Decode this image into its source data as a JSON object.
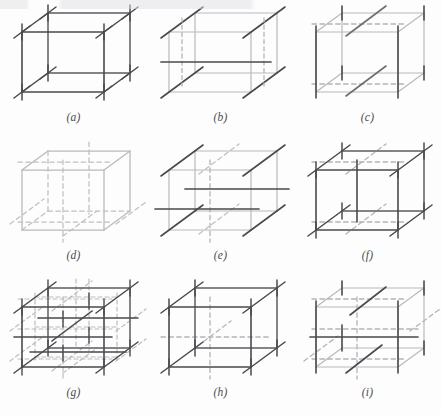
{
  "figure": {
    "type": "technical-illustration",
    "panel_count": 9,
    "columns": 3,
    "rows": 3
  },
  "colors": {
    "background": "#fdfdfd",
    "dark_line": "#4a4a4e",
    "mid_line": "#6d6d72",
    "light_line": "#b9b9bd",
    "dashed_line": "#b4b4b8",
    "caption_text": "#4a4a4a"
  },
  "geometry": {
    "front_left_x": 22,
    "front_right_x": 104,
    "front_top_y": 32,
    "front_bottom_y": 92,
    "depth_dx": 26,
    "depth_dy": -19,
    "tick_overshoot": 9
  },
  "panels": [
    {
      "id": "a",
      "caption": "(a)",
      "letter": "a",
      "name": "panel-a",
      "style": {
        "front_face": "dark",
        "back_face": "dark",
        "depth_edges": "dark",
        "hidden_edges": "none",
        "vertex_ticks": "all-eight",
        "interior": "none"
      }
    },
    {
      "id": "b",
      "caption": "(b)",
      "letter": "b",
      "name": "panel-b",
      "style": {
        "front_face": "light",
        "back_face": "light",
        "depth_edges": "dark",
        "hidden_edges": "dashed-vertical",
        "vertex_ticks": "none",
        "interior": "dark-horizontal-mid"
      }
    },
    {
      "id": "c",
      "caption": "(c)",
      "letter": "c",
      "name": "panel-c",
      "style": {
        "front_face": "light",
        "back_face": "light",
        "depth_edges": "light",
        "hidden_edges": "dashed-horizontal",
        "vertex_ticks": "vertical-only",
        "interior": "dark-diagonals"
      }
    },
    {
      "id": "d",
      "caption": "(d)",
      "letter": "d",
      "name": "panel-d",
      "style": {
        "front_face": "light",
        "back_face": "light",
        "depth_edges": "light",
        "hidden_edges": "dashed-all",
        "vertex_ticks": "none",
        "interior": "dashed-median-cross"
      }
    },
    {
      "id": "e",
      "caption": "(e)",
      "letter": "e",
      "name": "panel-e",
      "style": {
        "front_face": "light",
        "back_face": "light",
        "depth_edges": "dark",
        "hidden_edges": "dashed-vertical",
        "vertex_ticks": "none",
        "interior": "two-dark-horizontals"
      }
    },
    {
      "id": "f",
      "caption": "(f)",
      "letter": "f",
      "name": "panel-f",
      "style": {
        "front_face": "dark",
        "back_face": "dark",
        "depth_edges": "dark",
        "hidden_edges": "dashed-back",
        "vertex_ticks": "all-eight",
        "interior": "dark-vertical-median"
      }
    },
    {
      "id": "g",
      "caption": "(g)",
      "letter": "g",
      "name": "panel-g",
      "style": {
        "front_face": "dark",
        "back_face": "dark",
        "depth_edges": "dark",
        "hidden_edges": "dashed-full-lattice",
        "vertex_ticks": "all-eight",
        "interior": "2x2x2-subdivision-grid"
      }
    },
    {
      "id": "h",
      "caption": "(h)",
      "letter": "h",
      "name": "panel-h",
      "style": {
        "front_face": "dark",
        "back_face": "dark",
        "depth_edges": "dark",
        "hidden_edges": "dashed-center-cross",
        "vertex_ticks": "all-eight",
        "interior": "dashed-body-center-star"
      }
    },
    {
      "id": "i",
      "caption": "(i)",
      "letter": "i",
      "name": "panel-i",
      "style": {
        "front_face": "light",
        "back_face": "light",
        "depth_edges": "light",
        "hidden_edges": "dashed-mid-planes",
        "vertex_ticks": "vertical-only",
        "interior": "dark-mid-horizontal-and-diagonals"
      }
    }
  ]
}
